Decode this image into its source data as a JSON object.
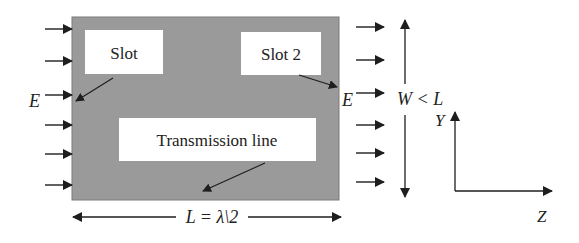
{
  "diagram": {
    "plate_color": "#9a9a9a",
    "box_color": "#ffffff",
    "ink_color": "#1e1e1e",
    "labels": {
      "slot1": "Slot",
      "slot2": "Slot 2",
      "transmission_line": "Transmission line",
      "e_left": "E",
      "e_right": "E",
      "width_label": "W < L",
      "length_label": "L = λ\\2",
      "axis_y": "Y",
      "axis_z": "Z"
    },
    "incident_arrows_left_count": 6,
    "outgoing_arrows_right_count": 6
  }
}
